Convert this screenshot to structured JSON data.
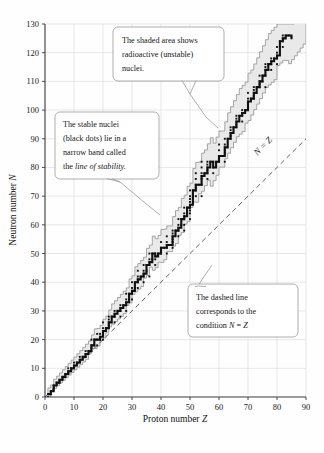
{
  "chart_data": {
    "type": "scatter",
    "title": "",
    "xlabel": "Proton number Z",
    "ylabel": "Neutron number N",
    "xlabel_prefix": "Proton number ",
    "xlabel_symbol": "Z",
    "ylabel_prefix": "Neutron number ",
    "ylabel_symbol": "N",
    "xlim": [
      0,
      90
    ],
    "ylim": [
      0,
      130
    ],
    "xticks": [
      0,
      10,
      20,
      30,
      40,
      50,
      60,
      70,
      80,
      90
    ],
    "yticks": [
      0,
      10,
      20,
      30,
      40,
      50,
      60,
      70,
      80,
      90,
      100,
      110,
      120,
      130
    ],
    "grid": true,
    "legend": "none",
    "series": [
      {
        "name": "line of stability (stable nuclei, black dots)",
        "type": "scatter+step",
        "points": [
          [
            1,
            0
          ],
          [
            1,
            1
          ],
          [
            2,
            1
          ],
          [
            2,
            2
          ],
          [
            3,
            3
          ],
          [
            3,
            4
          ],
          [
            4,
            5
          ],
          [
            5,
            5
          ],
          [
            5,
            6
          ],
          [
            6,
            6
          ],
          [
            6,
            7
          ],
          [
            7,
            7
          ],
          [
            7,
            8
          ],
          [
            8,
            8
          ],
          [
            8,
            9
          ],
          [
            8,
            10
          ],
          [
            9,
            10
          ],
          [
            10,
            10
          ],
          [
            10,
            11
          ],
          [
            10,
            12
          ],
          [
            11,
            12
          ],
          [
            12,
            12
          ],
          [
            12,
            13
          ],
          [
            12,
            14
          ],
          [
            13,
            14
          ],
          [
            14,
            14
          ],
          [
            14,
            15
          ],
          [
            14,
            16
          ],
          [
            15,
            16
          ],
          [
            16,
            16
          ],
          [
            16,
            17
          ],
          [
            16,
            18
          ],
          [
            16,
            20
          ],
          [
            17,
            18
          ],
          [
            17,
            20
          ],
          [
            18,
            18
          ],
          [
            18,
            20
          ],
          [
            18,
            22
          ],
          [
            19,
            20
          ],
          [
            19,
            21
          ],
          [
            19,
            22
          ],
          [
            20,
            20
          ],
          [
            20,
            22
          ],
          [
            20,
            23
          ],
          [
            20,
            24
          ],
          [
            20,
            26
          ],
          [
            21,
            24
          ],
          [
            22,
            24
          ],
          [
            22,
            25
          ],
          [
            22,
            26
          ],
          [
            22,
            27
          ],
          [
            22,
            28
          ],
          [
            23,
            28
          ],
          [
            24,
            26
          ],
          [
            24,
            28
          ],
          [
            24,
            29
          ],
          [
            24,
            30
          ],
          [
            25,
            30
          ],
          [
            26,
            28
          ],
          [
            26,
            30
          ],
          [
            26,
            31
          ],
          [
            26,
            32
          ],
          [
            27,
            32
          ],
          [
            28,
            30
          ],
          [
            28,
            32
          ],
          [
            28,
            33
          ],
          [
            28,
            34
          ],
          [
            28,
            36
          ],
          [
            29,
            34
          ],
          [
            29,
            36
          ],
          [
            30,
            34
          ],
          [
            30,
            36
          ],
          [
            30,
            37
          ],
          [
            30,
            38
          ],
          [
            30,
            40
          ],
          [
            31,
            38
          ],
          [
            31,
            40
          ],
          [
            32,
            38
          ],
          [
            32,
            40
          ],
          [
            32,
            41
          ],
          [
            32,
            42
          ],
          [
            32,
            44
          ],
          [
            33,
            42
          ],
          [
            34,
            40
          ],
          [
            34,
            42
          ],
          [
            34,
            43
          ],
          [
            34,
            44
          ],
          [
            34,
            46
          ],
          [
            35,
            44
          ],
          [
            35,
            46
          ],
          [
            36,
            42
          ],
          [
            36,
            46
          ],
          [
            36,
            47
          ],
          [
            36,
            48
          ],
          [
            36,
            50
          ],
          [
            37,
            48
          ],
          [
            37,
            50
          ],
          [
            38,
            46
          ],
          [
            38,
            48
          ],
          [
            38,
            49
          ],
          [
            38,
            50
          ],
          [
            39,
            50
          ],
          [
            40,
            50
          ],
          [
            40,
            51
          ],
          [
            40,
            52
          ],
          [
            40,
            54
          ],
          [
            41,
            52
          ],
          [
            42,
            50
          ],
          [
            42,
            52
          ],
          [
            42,
            53
          ],
          [
            42,
            54
          ],
          [
            42,
            56
          ],
          [
            44,
            52
          ],
          [
            44,
            54
          ],
          [
            44,
            55
          ],
          [
            44,
            56
          ],
          [
            44,
            57
          ],
          [
            44,
            58
          ],
          [
            45,
            58
          ],
          [
            46,
            56
          ],
          [
            46,
            58
          ],
          [
            46,
            59
          ],
          [
            46,
            60
          ],
          [
            46,
            62
          ],
          [
            47,
            60
          ],
          [
            47,
            62
          ],
          [
            48,
            58
          ],
          [
            48,
            60
          ],
          [
            48,
            62
          ],
          [
            48,
            63
          ],
          [
            48,
            64
          ],
          [
            48,
            66
          ],
          [
            49,
            64
          ],
          [
            49,
            66
          ],
          [
            50,
            62
          ],
          [
            50,
            64
          ],
          [
            50,
            65
          ],
          [
            50,
            66
          ],
          [
            50,
            67
          ],
          [
            50,
            68
          ],
          [
            50,
            69
          ],
          [
            50,
            70
          ],
          [
            50,
            72
          ],
          [
            51,
            70
          ],
          [
            51,
            72
          ],
          [
            52,
            70
          ],
          [
            52,
            72
          ],
          [
            52,
            73
          ],
          [
            52,
            74
          ],
          [
            52,
            76
          ],
          [
            52,
            78
          ],
          [
            53,
            74
          ],
          [
            54,
            70
          ],
          [
            54,
            74
          ],
          [
            54,
            76
          ],
          [
            54,
            77
          ],
          [
            54,
            78
          ],
          [
            54,
            80
          ],
          [
            54,
            82
          ],
          [
            55,
            78
          ],
          [
            56,
            76
          ],
          [
            56,
            78
          ],
          [
            56,
            79
          ],
          [
            56,
            80
          ],
          [
            56,
            81
          ],
          [
            56,
            82
          ],
          [
            57,
            82
          ],
          [
            58,
            78
          ],
          [
            58,
            80
          ],
          [
            58,
            82
          ],
          [
            59,
            82
          ],
          [
            60,
            82
          ],
          [
            60,
            83
          ],
          [
            60,
            84
          ],
          [
            60,
            86
          ],
          [
            60,
            88
          ],
          [
            62,
            82
          ],
          [
            62,
            85
          ],
          [
            62,
            86
          ],
          [
            62,
            87
          ],
          [
            62,
            88
          ],
          [
            62,
            90
          ],
          [
            63,
            90
          ],
          [
            64,
            90
          ],
          [
            64,
            91
          ],
          [
            64,
            92
          ],
          [
            64,
            93
          ],
          [
            64,
            94
          ],
          [
            65,
            94
          ],
          [
            66,
            94
          ],
          [
            66,
            95
          ],
          [
            66,
            96
          ],
          [
            66,
            97
          ],
          [
            66,
            98
          ],
          [
            67,
            98
          ],
          [
            68,
            96
          ],
          [
            68,
            98
          ],
          [
            68,
            99
          ],
          [
            68,
            100
          ],
          [
            69,
            100
          ],
          [
            70,
            100
          ],
          [
            70,
            102
          ],
          [
            70,
            103
          ],
          [
            70,
            104
          ],
          [
            70,
            106
          ],
          [
            71,
            104
          ],
          [
            72,
            104
          ],
          [
            72,
            105
          ],
          [
            72,
            106
          ],
          [
            72,
            107
          ],
          [
            72,
            108
          ],
          [
            73,
            108
          ],
          [
            74,
            108
          ],
          [
            74,
            109
          ],
          [
            74,
            110
          ],
          [
            74,
            112
          ],
          [
            75,
            110
          ],
          [
            75,
            112
          ],
          [
            76,
            108
          ],
          [
            76,
            112
          ],
          [
            76,
            114
          ],
          [
            76,
            115
          ],
          [
            76,
            116
          ],
          [
            77,
            114
          ],
          [
            77,
            116
          ],
          [
            78,
            114
          ],
          [
            78,
            116
          ],
          [
            78,
            117
          ],
          [
            78,
            118
          ],
          [
            79,
            118
          ],
          [
            80,
            116
          ],
          [
            80,
            118
          ],
          [
            80,
            119
          ],
          [
            80,
            120
          ],
          [
            80,
            122
          ],
          [
            81,
            122
          ],
          [
            81,
            124
          ],
          [
            82,
            122
          ],
          [
            82,
            124
          ],
          [
            82,
            125
          ],
          [
            82,
            126
          ],
          [
            83,
            126
          ],
          [
            84,
            126
          ],
          [
            85,
            125
          ]
        ]
      }
    ],
    "annotations": [
      {
        "name": "shaded-area-callout",
        "lines": [
          "The shaded area shows",
          "radioactive (unstable)",
          "nuclei."
        ],
        "target": [
          60,
          107
        ]
      },
      {
        "name": "stable-nuclei-callout",
        "lines": [
          "The stable nuclei",
          "(black dots) lie in a",
          "narrow band called",
          "the line of stability."
        ],
        "italic_tail": "line of stability.",
        "target": [
          41,
          58
        ]
      },
      {
        "name": "dashed-line-callout",
        "lines": [
          "The dashed line",
          "corresponds to the",
          "condition N = Z"
        ],
        "target": [
          56,
          60
        ]
      }
    ],
    "reference_line": {
      "name": "N = Z",
      "label": "N = Z",
      "style": "dashed",
      "from": [
        0,
        0
      ],
      "to": [
        90,
        90
      ]
    },
    "band": {
      "name": "radioactive (unstable) nuclei region",
      "fill": "#e9e9e9",
      "stroke": "#8c8c8c"
    },
    "colors": {
      "stable": "#111111",
      "band_fill": "#e9e9e9",
      "band_stroke": "#8c8c8c",
      "grid": "#d9d9d9",
      "axis": "#3a3a3a",
      "callout_border": "#9a9a9a",
      "background": "#fefefe"
    }
  },
  "callouts": {
    "shaded": {
      "l1": "The shaded area shows",
      "l2": "radioactive (unstable)",
      "l3": "nuclei."
    },
    "stable": {
      "l1": "The stable nuclei",
      "l2": "(black dots) lie in a",
      "l3": "narrow band called",
      "l4a": "the ",
      "l4b": "line of stability."
    },
    "dashed": {
      "l1": "The dashed line",
      "l2": "corresponds to the",
      "l3a": "condition ",
      "l3b": "N",
      "l3c": " = ",
      "l3d": "Z"
    }
  },
  "axes": {
    "x_title_prefix": "Proton number ",
    "x_title_symbol": "Z",
    "y_title_prefix": "Neutron number ",
    "y_title_symbol": "N",
    "nz_label_n": "N",
    "nz_label_eq": " = ",
    "nz_label_z": "Z"
  }
}
